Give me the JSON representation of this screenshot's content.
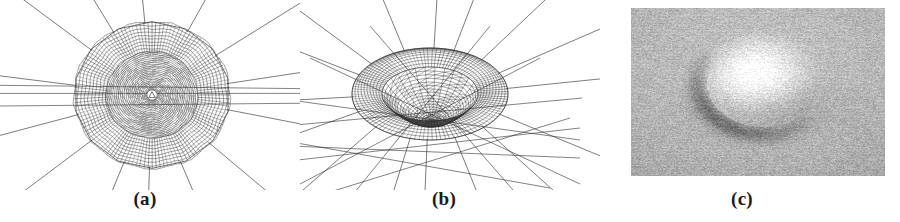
{
  "figure": {
    "background_color": "#ffffff",
    "width": 900,
    "height": 222,
    "panel_count": 3
  },
  "panels": [
    {
      "id": "a",
      "caption": "(a)",
      "kind": "mesh-2d-top-view",
      "description": "Top view of an axisymmetric radial finite element mesh with concentric rings; dense dark annular band of elements surrounding a finer spiral-like inner ring region, with long straight radial edges extending outward to the far field.",
      "center_x": 152,
      "center_y": 95,
      "outer_radius": 78,
      "dark_band_inner_radius": 46,
      "dark_band_outer_radius": 78,
      "ring_count": 26,
      "spoke_count": 36,
      "far_field_spoke_count": 14,
      "line_color": "#2a2a2a",
      "band_color": "#1a1a1a"
    },
    {
      "id": "b",
      "caption": "(b)",
      "kind": "mesh-3d-perspective",
      "description": "Perspective view of the same mesh after deformation: an elliptical dark torus-like ridge with a depressed, finely triangulated interior cap, surrounded by straight far-field edges radiating outward.",
      "center_x": 430,
      "center_y": 88,
      "ellipse_rx": 78,
      "ellipse_ry": 46,
      "band_inner_rx": 48,
      "band_inner_ry": 27,
      "ring_count": 18,
      "spoke_count": 30,
      "far_field_spoke_count": 16,
      "line_color": "#2a2a2a",
      "band_color": "#1a1a1a"
    },
    {
      "id": "c",
      "caption": "(c)",
      "kind": "photograph-grayscale",
      "description": "Grayscale photograph of a rounded blister-like bump raised from a noisy woven fabric surface, lit from the upper left so that the top of the bump is bright and a dark crescent shadow lies along its lower-left edge.",
      "frame_x": 631,
      "frame_y": 8,
      "frame_width": 254,
      "frame_height": 168,
      "background_gray": "#c9c9c9",
      "highlight_gray": "#f2f2f2",
      "shadow_gray": "#6d6d6d",
      "bump_center_x": 0.52,
      "bump_center_y": 0.44,
      "bump_rx": 0.26,
      "bump_ry": 0.31
    }
  ],
  "captions": {
    "a": "(a)",
    "b": "(b)",
    "c": "(c)"
  }
}
